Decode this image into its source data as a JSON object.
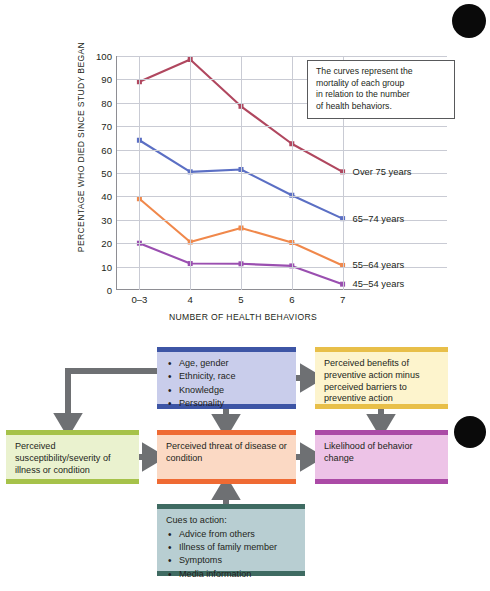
{
  "chart_data": {
    "type": "line",
    "title": "",
    "xlabel": "NUMBER OF HEALTH BEHAVIORS",
    "ylabel": "PERCENTAGE WHO DIED SINCE STUDY BEGAN",
    "categories": [
      "0–3",
      "4",
      "5",
      "6",
      "7"
    ],
    "ylim": [
      0,
      100
    ],
    "yticks": [
      0,
      10,
      20,
      30,
      40,
      50,
      60,
      70,
      80,
      90,
      100
    ],
    "grid": true,
    "legend_position": "right-inline",
    "annotation": "The curves represent the mortality of each group in relation to the number of health behaviors.",
    "series": [
      {
        "name": "Over 75 years",
        "color": "#b0475f",
        "values": [
          89,
          98.5,
          78.5,
          62.5,
          50.5
        ]
      },
      {
        "name": "65–74 years",
        "color": "#5b6fc4",
        "values": [
          64,
          50.5,
          51.5,
          40.5,
          30.5
        ]
      },
      {
        "name": "55–64 years",
        "color": "#f0884b",
        "values": [
          39,
          20.5,
          26.5,
          20.3,
          10.5
        ]
      },
      {
        "name": "45–54 years",
        "color": "#9a4fb0",
        "values": [
          20,
          11.3,
          11.2,
          10.3,
          2.5
        ]
      }
    ]
  },
  "chart": {
    "note_lines": [
      "The curves represent the",
      "mortality of each group",
      "in relation to the number",
      "of health behaviors."
    ],
    "series_labels": [
      "Over 75 years",
      "65–74 years",
      "55–64 years",
      "45–54 years"
    ]
  },
  "diagram": {
    "type": "health-belief-model",
    "arrow_color": "#6e7073",
    "nodes": [
      {
        "id": "demographics",
        "lead": "",
        "items": [
          "Age, gender",
          "Ethnicity, race",
          "Knowledge",
          "Personality"
        ],
        "fill": "#c9cdeb",
        "edge": "#3d55a5"
      },
      {
        "id": "benefits",
        "text": "Perceived benefits of preventive action minus perceived barriers to preventive action",
        "fill": "#fdf4cd",
        "edge": "#e8bf49"
      },
      {
        "id": "susceptibility",
        "text": "Perceived susceptibility/severity of illness or condition",
        "fill": "#eaf2cf",
        "edge": "#a6c24a"
      },
      {
        "id": "threat",
        "text": "Perceived threat of disease or condition",
        "fill": "#fbd9c4",
        "edge": "#ef6a33"
      },
      {
        "id": "likelihood",
        "text": "Likelihood of behavior change",
        "fill": "#edc3e7",
        "edge": "#ab4aa6"
      },
      {
        "id": "cues",
        "lead": "Cues to action:",
        "items": [
          "Advice from others",
          "Illness of family member",
          "Symptoms",
          "Media information"
        ],
        "fill": "#b8ced2",
        "edge": "#3f6b62"
      }
    ]
  }
}
